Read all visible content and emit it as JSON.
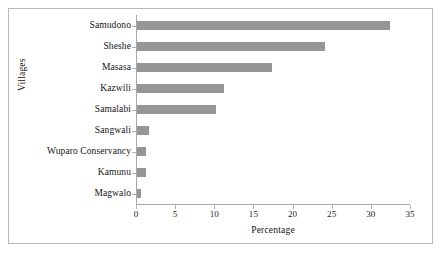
{
  "chart_data": {
    "type": "bar",
    "orientation": "horizontal",
    "title": "",
    "xlabel": "Percentage",
    "ylabel": "Villages",
    "categories": [
      "Samudono",
      "Sheshe",
      "Masasa",
      "Kazwili",
      "Samalabi",
      "Sangwali",
      "Wuparo Conservancy",
      "Kamunu",
      "Magwalo"
    ],
    "values": [
      32.3,
      24.0,
      17.2,
      11.1,
      10.1,
      1.5,
      1.1,
      1.1,
      0.5
    ],
    "xlim": [
      0,
      35
    ],
    "xticks": [
      0,
      5,
      10,
      15,
      20,
      25,
      30,
      35
    ],
    "xtick_labels": [
      "0",
      "5",
      "10",
      "15",
      "20",
      "25",
      "30",
      "35"
    ],
    "grid": false,
    "legend": false,
    "bar_color": "#969696",
    "axis_color": "#a8a8a8",
    "frame_color": "#b9b9b9",
    "background": "#ffffff"
  }
}
